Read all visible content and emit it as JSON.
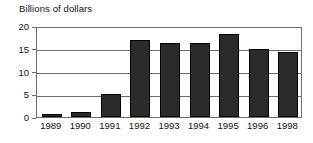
{
  "chart_data": {
    "type": "bar",
    "title": "Billions of dollars",
    "xlabel": "",
    "ylabel": "",
    "categories": [
      "1989",
      "1990",
      "1991",
      "1992",
      "1993",
      "1994",
      "1995",
      "1996",
      "1998"
    ],
    "values": [
      0.6,
      1.2,
      5.0,
      17.0,
      16.2,
      16.2,
      18.2,
      15.0,
      14.3
    ],
    "ylim": [
      0,
      20
    ],
    "yticks": [
      0,
      5,
      10,
      15,
      20
    ],
    "ytick_labels": [
      "0",
      "5",
      "10",
      "15",
      "20"
    ],
    "grid": true,
    "grid_axis": "y",
    "legend": false,
    "legend_position": "none",
    "bar_color": "#2b2b2b",
    "bar_edge_color": "#000000",
    "axis_color": "#6d6d6d",
    "background_color": "#ffffff"
  }
}
